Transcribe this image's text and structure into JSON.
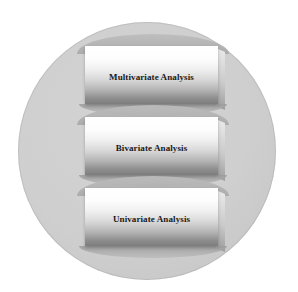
{
  "diagram": {
    "background_color": "#ffffff",
    "circle": {
      "name": "background-circle",
      "fill_color": "#cfcfcf",
      "border_color": "#a0a0a0"
    },
    "slabs": [
      {
        "id": "multivariate",
        "label": "Multivariate Analysis",
        "position": "top",
        "face_top_color": "#ffffff",
        "face_bottom_color": "#7d7d7d",
        "text_color": "#1a1a1a"
      },
      {
        "id": "bivariate",
        "label": "Bivariate Analysis",
        "position": "middle",
        "face_top_color": "#ffffff",
        "face_bottom_color": "#7d7d7d",
        "text_color": "#1a1a1a"
      },
      {
        "id": "univariate",
        "label": "Univariate Analysis",
        "position": "bottom",
        "face_top_color": "#ffffff",
        "face_bottom_color": "#7d7d7d",
        "text_color": "#1a1a1a"
      }
    ]
  }
}
